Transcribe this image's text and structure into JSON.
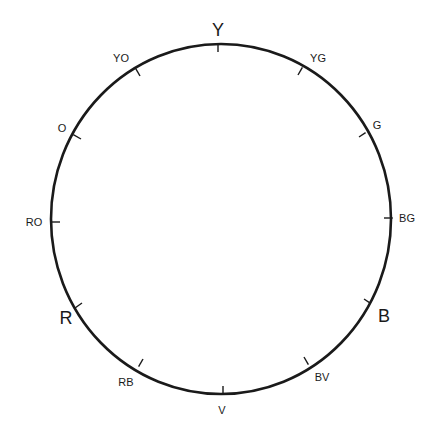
{
  "diagram": {
    "type": "color-wheel",
    "ring": {
      "cx": 221,
      "cy": 219,
      "rx": 170,
      "ry": 175,
      "stroke": "#1a1a1a"
    },
    "points": [
      {
        "id": "Y",
        "label": "Y",
        "size": "big",
        "tick": [
          218,
          44
        ],
        "inner": [
          218,
          52
        ],
        "text": [
          218,
          36
        ]
      },
      {
        "id": "YG",
        "label": "YG",
        "size": "small",
        "tick": [
          302,
          68
        ],
        "inner": [
          298,
          75
        ],
        "text": [
          318,
          62
        ]
      },
      {
        "id": "G",
        "label": "G",
        "size": "small",
        "tick": [
          365,
          133
        ],
        "inner": [
          359,
          137
        ],
        "text": [
          377,
          129
        ]
      },
      {
        "id": "BG",
        "label": "BG",
        "size": "small",
        "tick": [
          392,
          218
        ],
        "inner": [
          384,
          218
        ],
        "text": [
          407,
          222
        ]
      },
      {
        "id": "B",
        "label": "B",
        "size": "big",
        "tick": [
          370,
          303
        ],
        "inner": [
          364,
          299
        ],
        "text": [
          384,
          322
        ]
      },
      {
        "id": "BV",
        "label": "BV",
        "size": "small",
        "tick": [
          308,
          364
        ],
        "inner": [
          304,
          357
        ],
        "text": [
          322,
          381
        ]
      },
      {
        "id": "V",
        "label": "V",
        "size": "small",
        "tick": [
          223,
          394
        ],
        "inner": [
          223,
          386
        ],
        "text": [
          222,
          414
        ]
      },
      {
        "id": "RB",
        "label": "RB",
        "size": "small",
        "tick": [
          139,
          366
        ],
        "inner": [
          143,
          359
        ],
        "text": [
          126,
          386
        ]
      },
      {
        "id": "R",
        "label": "R",
        "size": "big",
        "tick": [
          75,
          308
        ],
        "inner": [
          82,
          303
        ],
        "text": [
          66,
          324
        ]
      },
      {
        "id": "RO",
        "label": "RO",
        "size": "small",
        "tick": [
          52,
          222
        ],
        "inner": [
          60,
          222
        ],
        "text": [
          34,
          226
        ]
      },
      {
        "id": "O",
        "label": "O",
        "size": "small",
        "tick": [
          74,
          135
        ],
        "inner": [
          81,
          139
        ],
        "text": [
          62,
          132
        ]
      },
      {
        "id": "YO",
        "label": "YO",
        "size": "small",
        "tick": [
          136,
          69
        ],
        "inner": [
          140,
          76
        ],
        "text": [
          121,
          62
        ]
      }
    ]
  }
}
